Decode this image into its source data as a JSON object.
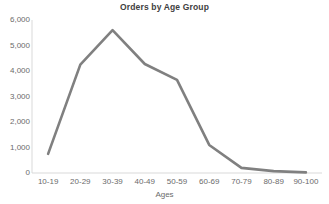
{
  "chart_data": {
    "type": "line",
    "title": "Orders by Age Group",
    "xlabel": "Ages",
    "ylabel": "",
    "categories": [
      "10-19",
      "20-29",
      "30-39",
      "40-49",
      "50-59",
      "60-69",
      "70-79",
      "80-89",
      "90-100"
    ],
    "values": [
      750,
      4250,
      5600,
      4275,
      3650,
      1100,
      200,
      75,
      25
    ],
    "series": [
      {
        "name": "Orders",
        "values": [
          750,
          4250,
          5600,
          4275,
          3650,
          1100,
          200,
          75,
          25
        ]
      }
    ],
    "ylim": [
      0,
      6000
    ],
    "ytick_labels": [
      "6,000",
      "5,000",
      "4,000",
      "3,000",
      "2,000",
      "1,000",
      "0"
    ],
    "ytick_values": [
      6000,
      5000,
      4000,
      3000,
      2000,
      1000,
      0
    ],
    "grid": false,
    "legend": "none",
    "line_color": "#808080",
    "axis_color": "#d9d9d9",
    "text_color": "#6b6b6b",
    "title_color": "#404040",
    "background_color": "#ffffff"
  }
}
